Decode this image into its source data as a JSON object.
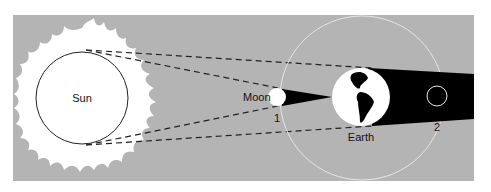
{
  "diagram": {
    "type": "lunar-eclipse-geometry",
    "labels": {
      "sun": "Sun",
      "moon": "Moon",
      "earth": "Earth",
      "position_1": "1",
      "position_2": "2"
    },
    "colors": {
      "background": "#b4b4b4",
      "body": "#ffffff",
      "shadow": "#000000",
      "orbit": "#e6e6e6",
      "dashed_lines": "#222222"
    }
  }
}
